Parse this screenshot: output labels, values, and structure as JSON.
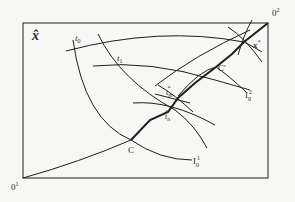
{
  "diagram": {
    "type": "edgeworth-box",
    "colors": {
      "line": "#1e1e1e",
      "background": "#f7f7f5"
    },
    "corner_label_top_left": "x̂",
    "origin_bottom_left": {
      "base": "0",
      "sup": "1"
    },
    "origin_top_right": {
      "base": "0",
      "sup": "2"
    },
    "curve_labels": {
      "t0": {
        "base": "t",
        "sub": "0"
      },
      "t1": {
        "base": "t",
        "sub": "1"
      },
      "tm_star": {
        "base": "t",
        "sub": "m",
        "sup": "*"
      },
      "tn_star": {
        "base": "t",
        "sub": "n",
        "sup": "*"
      },
      "x_star": {
        "base": "x",
        "sup": "*"
      }
    },
    "points": {
      "C": "C",
      "C_prime": "C'"
    },
    "indifference_labels": {
      "I0_1": {
        "base": "I",
        "sub": "0",
        "sup": "1"
      },
      "I0_2": {
        "base": "I",
        "sub": "0",
        "sup": "2"
      }
    }
  }
}
